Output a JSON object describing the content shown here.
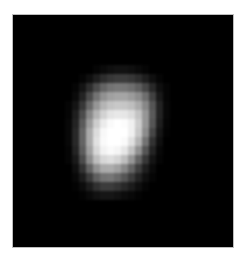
{
  "image": {
    "description": "Blurred point source (star-like blob) on black background",
    "background_color": "#000000",
    "margin_color": "#ffffff",
    "frame": {
      "left": 12,
      "top": 14,
      "width": 222,
      "height": 234
    },
    "grid": {
      "left_in_frame": 52,
      "top_in_frame": 50,
      "cols": 16,
      "rows": 15,
      "cell_w": 7,
      "cell_h": 9,
      "intensity": [
        [
          0,
          0,
          0,
          0,
          5,
          10,
          15,
          18,
          18,
          15,
          10,
          5,
          0,
          0,
          0,
          0
        ],
        [
          0,
          0,
          5,
          15,
          30,
          45,
          55,
          60,
          60,
          55,
          45,
          30,
          15,
          5,
          0,
          0
        ],
        [
          0,
          5,
          20,
          45,
          75,
          100,
          115,
          120,
          118,
          110,
          95,
          70,
          40,
          15,
          5,
          0
        ],
        [
          0,
          10,
          35,
          75,
          115,
          145,
          160,
          165,
          165,
          155,
          140,
          110,
          65,
          25,
          5,
          0
        ],
        [
          5,
          20,
          55,
          105,
          150,
          180,
          195,
          200,
          198,
          190,
          170,
          135,
          85,
          35,
          8,
          0
        ],
        [
          5,
          30,
          75,
          135,
          180,
          210,
          228,
          232,
          230,
          220,
          195,
          150,
          90,
          35,
          8,
          0
        ],
        [
          8,
          35,
          90,
          155,
          205,
          235,
          250,
          255,
          252,
          240,
          205,
          150,
          85,
          30,
          5,
          0
        ],
        [
          8,
          40,
          100,
          170,
          220,
          248,
          255,
          255,
          255,
          240,
          200,
          140,
          70,
          22,
          3,
          0
        ],
        [
          8,
          40,
          100,
          170,
          225,
          250,
          255,
          255,
          250,
          225,
          180,
          115,
          50,
          15,
          0,
          0
        ],
        [
          5,
          35,
          92,
          160,
          215,
          242,
          250,
          245,
          230,
          195,
          145,
          85,
          35,
          8,
          0,
          0
        ],
        [
          5,
          25,
          75,
          140,
          190,
          215,
          222,
          212,
          190,
          150,
          100,
          55,
          20,
          5,
          0,
          0
        ],
        [
          0,
          15,
          50,
          100,
          145,
          170,
          172,
          160,
          135,
          100,
          62,
          30,
          10,
          0,
          0,
          0
        ],
        [
          0,
          8,
          28,
          60,
          95,
          115,
          118,
          105,
          85,
          60,
          35,
          15,
          5,
          0,
          0,
          0
        ],
        [
          0,
          3,
          12,
          28,
          48,
          60,
          60,
          52,
          40,
          28,
          15,
          5,
          0,
          0,
          0,
          0
        ],
        [
          0,
          0,
          3,
          10,
          18,
          22,
          22,
          18,
          12,
          8,
          3,
          0,
          0,
          0,
          0,
          0
        ]
      ]
    }
  }
}
